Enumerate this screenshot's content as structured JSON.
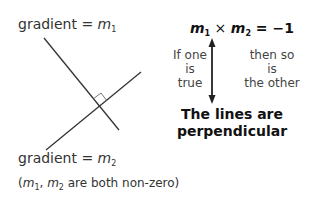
{
  "diagram": {
    "label_line1": {
      "prefix": "gradient = ",
      "var": "m",
      "sub": "1"
    },
    "label_line2": {
      "prefix": "gradient = ",
      "var": "m",
      "sub": "2"
    },
    "note": {
      "open": "(",
      "v1": "m",
      "s1": "1",
      "sep": ", ",
      "v2": "m",
      "s2": "2",
      "rest": " are both non-zero)"
    },
    "equation": {
      "v1": "m",
      "s1": "1",
      "times": " × ",
      "v2": "m",
      "s2": "2",
      "rest": " = −1"
    },
    "left_condition": [
      "If one",
      "is",
      "true"
    ],
    "right_condition": [
      "then so",
      "is",
      "the other"
    ],
    "conclusion": [
      "The lines are",
      "perpendicular"
    ],
    "line_color": "#333333",
    "right_angle_marker": true
  }
}
